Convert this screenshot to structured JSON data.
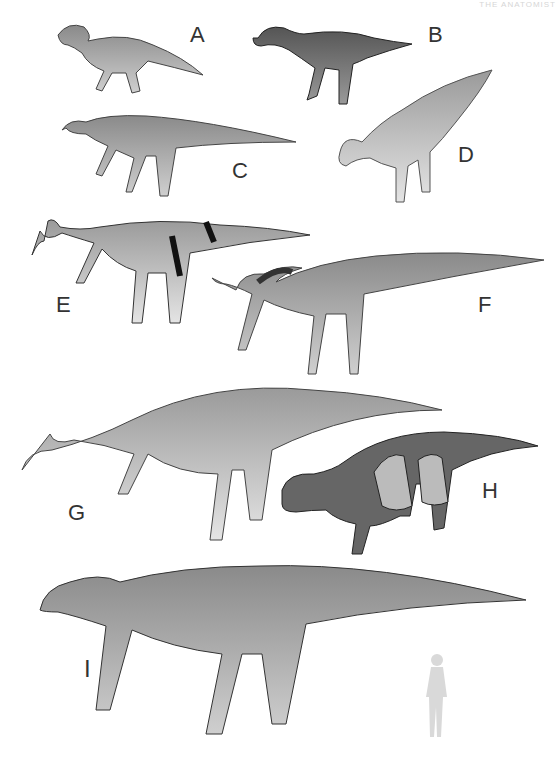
{
  "header": {
    "text": "THE ANATOMIST"
  },
  "figure": {
    "labels": [
      {
        "id": "A",
        "x": 190,
        "y": 22
      },
      {
        "id": "B",
        "x": 428,
        "y": 22
      },
      {
        "id": "C",
        "x": 232,
        "y": 158
      },
      {
        "id": "D",
        "x": 458,
        "y": 142
      },
      {
        "id": "E",
        "x": 56,
        "y": 292
      },
      {
        "id": "F",
        "x": 478,
        "y": 292
      },
      {
        "id": "G",
        "x": 68,
        "y": 500
      },
      {
        "id": "H",
        "x": 482,
        "y": 478
      },
      {
        "id": "I",
        "x": 84,
        "y": 655
      }
    ],
    "scale_figure": "human-silhouette",
    "colors": {
      "background": "#ffffff",
      "label": "#333333",
      "silhouette": "#d9d9d9"
    }
  }
}
